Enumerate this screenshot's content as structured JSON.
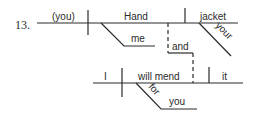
{
  "diagram": {
    "number": "13.",
    "clause1": {
      "subject": "(you)",
      "verb": "Hand",
      "indirect_object": "me",
      "direct_object": "jacket",
      "modifier": "your"
    },
    "conjunction": "and",
    "clause2": {
      "subject": "I",
      "verb": "will mend",
      "direct_object": "it",
      "preposition": "for",
      "prep_object": "you"
    }
  }
}
